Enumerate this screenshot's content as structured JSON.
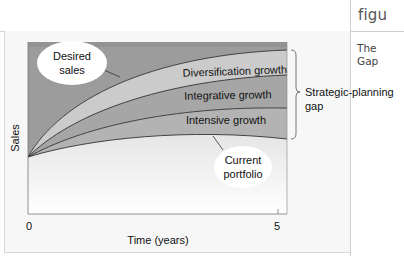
{
  "side_panel": {
    "title": "figu",
    "body_lines": [
      "The",
      "Gap"
    ]
  },
  "diagram": {
    "ylabel": "Sales",
    "xlabel": "Time (years)",
    "x_ticks": [
      "0",
      "5"
    ],
    "bands": [
      {
        "label": "Diversification growth",
        "color": "#cbcbcb"
      },
      {
        "label": "Integrative growth",
        "color": "#a6a6a6"
      },
      {
        "label": "Intensive growth",
        "color": "#b3b3b3"
      }
    ],
    "callouts": {
      "desired_sales": [
        "Desired",
        "sales"
      ],
      "current_portfolio": [
        "Current",
        "portfolio"
      ]
    },
    "bracket_label": [
      "Strategic-planning",
      "gap"
    ],
    "colors": {
      "top_background": "#9c9c9c",
      "curve_line": "#333333",
      "ellipse_fill": "#ffffff"
    }
  }
}
